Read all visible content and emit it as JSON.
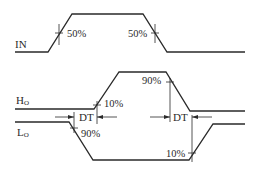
{
  "diagram": {
    "type": "timing-diagram",
    "signals": [
      {
        "id": "in",
        "label": "IN",
        "subscript": ""
      },
      {
        "id": "ho",
        "label": "H",
        "subscript": "O"
      },
      {
        "id": "lo",
        "label": "L",
        "subscript": "O"
      }
    ],
    "annotations": {
      "in_rise_threshold": "50%",
      "in_fall_threshold": "50%",
      "ho_rise_threshold": "10%",
      "ho_fall_threshold": "90%",
      "lo_fall_threshold": "90%",
      "lo_rise_threshold": "10%",
      "dead_time_left": "DT",
      "dead_time_right": "DT"
    },
    "colors": {
      "line": "#2a2a2a",
      "background": "#ffffff"
    }
  }
}
